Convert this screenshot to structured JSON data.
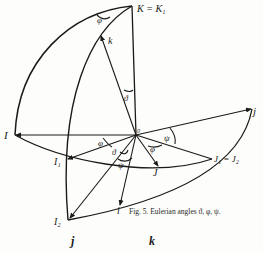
{
  "figure": {
    "caption": "Fig. 5.  Eulerian angles ϑ, φ, ψ.",
    "colors": {
      "ink": "#1a1a1a",
      "paper": "#fdfdfb"
    },
    "points": {
      "origin": "0",
      "K": "K = K₁",
      "k": "k",
      "I": "I",
      "j": "j",
      "I1": "I₁",
      "J": "J",
      "J1": "J₁ = J₂",
      "i": "i",
      "I2": "I₂"
    },
    "angles": {
      "phi_top": "φ",
      "theta_top": "ϑ",
      "psi_right": "ψ",
      "phi_left": "φ",
      "phi_mid": "φ",
      "theta_mid": "ϑ",
      "psi_mid": "ψ"
    }
  },
  "footer": {
    "left_label": "j",
    "right_label": "k"
  }
}
